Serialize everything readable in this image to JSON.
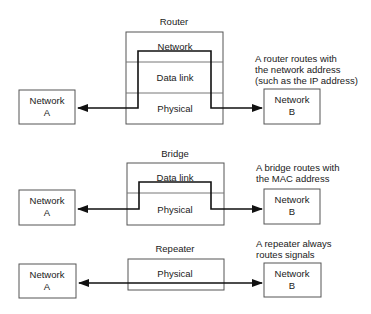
{
  "colors": {
    "background": "#ffffff",
    "box_stroke": "#555555",
    "path_stroke": "#111111",
    "text": "#1a1a1a"
  },
  "router": {
    "title": "Router",
    "layers": [
      "Network",
      "Data link",
      "Physical"
    ],
    "network_a": {
      "line1": "Network",
      "line2": "A"
    },
    "network_b": {
      "line1": "Network",
      "line2": "B"
    },
    "note": [
      "A router routes with",
      "the network address",
      "(such as the IP address)"
    ]
  },
  "bridge": {
    "title": "Bridge",
    "layers": [
      "Data link",
      "Physical"
    ],
    "network_a": {
      "line1": "Network",
      "line2": "A"
    },
    "network_b": {
      "line1": "Network",
      "line2": "B"
    },
    "note": [
      "A bridge routes with",
      "the MAC address"
    ]
  },
  "repeater": {
    "title": "Repeater",
    "layers": [
      "Physical"
    ],
    "network_a": {
      "line1": "Network",
      "line2": "A"
    },
    "network_b": {
      "line1": "Network",
      "line2": "B"
    },
    "note": [
      "A repeater always",
      "routes signals"
    ]
  }
}
